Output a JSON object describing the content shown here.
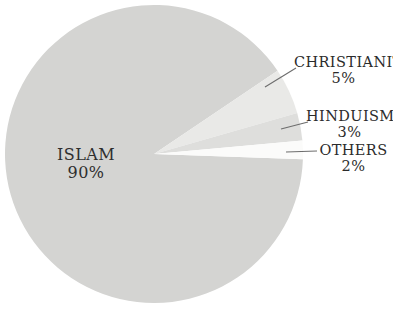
{
  "chart_data": {
    "type": "pie",
    "title": "",
    "subtitle": "",
    "xlabel": "",
    "ylabel": "",
    "legend_position": "none",
    "grid": false,
    "unit": "%",
    "categories": [
      "ISLAM",
      "CHRISTIANITY",
      "HINDUISM",
      "OTHERS"
    ],
    "values": [
      90,
      5,
      3,
      2
    ],
    "slices": [
      {
        "label": "ISLAM",
        "value": 90,
        "value_text": "90%",
        "color": "#d4d4d2",
        "label_placement": "inside"
      },
      {
        "label": "CHRISTIANITY",
        "value": 5,
        "value_text": "5%",
        "color": "#e9e9e7",
        "label_placement": "callout-right"
      },
      {
        "label": "HINDUISM",
        "value": 3,
        "value_text": "3%",
        "color": "#dededc",
        "label_placement": "callout-right"
      },
      {
        "label": "OTHERS",
        "value": 2,
        "value_text": "2%",
        "color": "#fbfbfa",
        "label_placement": "callout-right"
      }
    ]
  },
  "colors": {
    "background": "#ffffff",
    "text": "#2b2b2b",
    "leader_line": "#6d6d6d",
    "islam": "#d4d4d2",
    "christianity": "#e9e9e7",
    "hinduism": "#dededc",
    "others": "#fbfbfa"
  },
  "labels": {
    "islam": {
      "name": "ISLAM",
      "value": "90%"
    },
    "christianity": {
      "name": "CHRISTIANITY",
      "value": "5%"
    },
    "hinduism": {
      "name": "HINDUISM",
      "value": "3%"
    },
    "others": {
      "name": "OTHERS",
      "value": "2%"
    }
  }
}
